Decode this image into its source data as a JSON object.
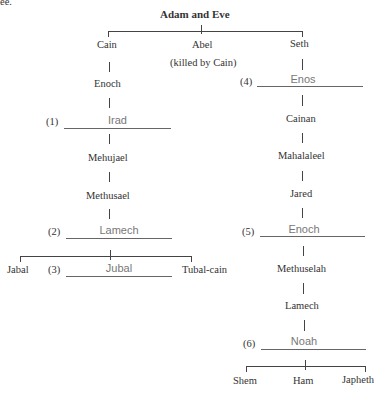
{
  "header_fragment": "ee.",
  "root": "Adam and Eve",
  "children": {
    "cain": "Cain",
    "abel": "Abel",
    "abel_note": "(killed by Cain)",
    "seth": "Seth"
  },
  "cain_line": {
    "enoch": "Enoch",
    "blank1": {
      "num": "(1)",
      "answer": "Irad"
    },
    "mehujael": "Mehujael",
    "methusael": "Methusael",
    "blank2": {
      "num": "(2)",
      "answer": "Lamech"
    },
    "jabal": "Jabal",
    "blank3": {
      "num": "(3)",
      "answer": "Jubal"
    },
    "tubalcain": "Tubal-cain"
  },
  "seth_line": {
    "blank4": {
      "num": "(4)",
      "answer": "Enos"
    },
    "cainan": "Cainan",
    "mahalaleel": "Mahalaleel",
    "jared": "Jared",
    "blank5": {
      "num": "(5)",
      "answer": "Enoch"
    },
    "methuselah": "Methuselah",
    "lamech": "Lamech",
    "blank6": {
      "num": "(6)",
      "answer": "Noah"
    },
    "shem": "Shem",
    "ham": "Ham",
    "japheth": "Japheth"
  }
}
